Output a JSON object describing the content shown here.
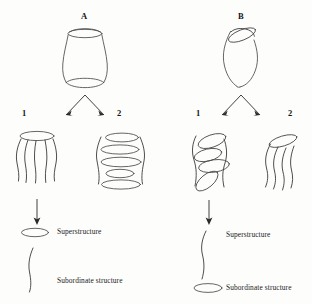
{
  "figure": {
    "background_color": "#fdfdfc",
    "line_color": "#4a4a4a",
    "text_color": "#1a1a1a"
  },
  "panels": [
    {
      "id": "A",
      "label": "A",
      "parent_shape": "waisted-cylinder-upright",
      "branches": [
        {
          "number": "1",
          "label": "1",
          "shape": "ellipse-over-wavy-lines"
        },
        {
          "number": "2",
          "label": "2",
          "shape": "stacked-ellipses"
        }
      ],
      "legend": [
        {
          "marker": "ellipse-marker",
          "label": "Superstructure"
        },
        {
          "marker": "wavy-line-marker",
          "label": "Subordinate structure"
        }
      ]
    },
    {
      "id": "B",
      "label": "B",
      "parent_shape": "curved-cylinder-tilted",
      "branches": [
        {
          "number": "1",
          "label": "1",
          "shape": "oblique-stacked-ellipses"
        },
        {
          "number": "2",
          "label": "2",
          "shape": "tilted-ellipse-over-wavy-lines"
        }
      ],
      "legend": [
        {
          "marker": "wavy-line-marker",
          "label": "Superstructure"
        },
        {
          "marker": "ellipse-marker",
          "label": "Subordinate structure"
        }
      ]
    }
  ]
}
